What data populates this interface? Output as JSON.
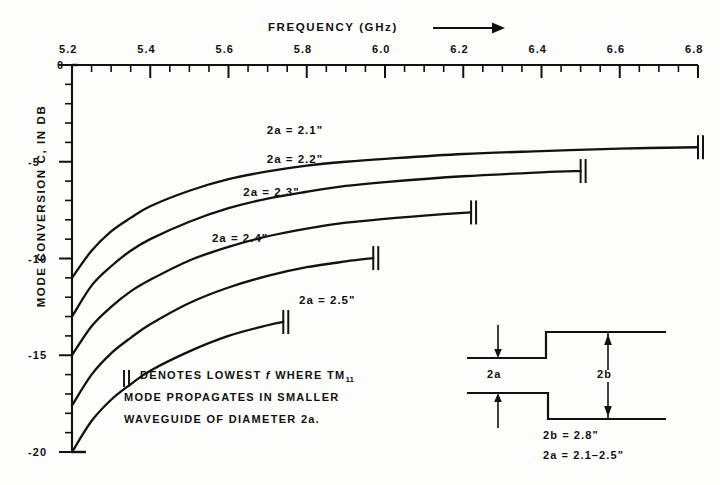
{
  "figure": {
    "kind": "engineering-line-chart",
    "ink_color": "#111111",
    "paper_color": "#fdfdfb"
  },
  "axes": {
    "x_title": "FREQUENCY   (GHz)",
    "x_title_arrow": "⟶",
    "y_title": "MODE CONVERSION  C,  IN  DB",
    "x_tick_labels": [
      "5.2",
      "5.4",
      "5.6",
      "5.8",
      "6.0",
      "6.2",
      "6.4",
      "6.6",
      "6.8"
    ],
    "y_tick_labels": [
      "0",
      "-5",
      "-10",
      "-15",
      "-20"
    ],
    "x_origin_label": "0"
  },
  "chart_data": {
    "type": "line",
    "xlabel": "FREQUENCY (GHz)",
    "ylabel": "MODE CONVERSION C, IN DB",
    "xlim": [
      5.2,
      6.8
    ],
    "ylim": [
      -20,
      0
    ],
    "xticks": [
      5.2,
      5.4,
      5.6,
      5.8,
      6.0,
      6.2,
      6.4,
      6.6,
      6.8
    ],
    "xtick_minor_step": 0.05,
    "yticks": [
      0,
      -5,
      -10,
      -15,
      -20
    ],
    "ytick_minor_step": 1,
    "grid": false,
    "legend": "inline-curve-labels",
    "series": [
      {
        "name": "2a = 2.1\"",
        "label": "2a = 2.1\"",
        "label_x": 5.8,
        "label_y": -3.4,
        "end_marker": "||",
        "end_marker_x": 6.8,
        "x": [
          5.2,
          5.25,
          5.3,
          5.35,
          5.4,
          5.5,
          5.6,
          5.7,
          5.8,
          5.9,
          6.0,
          6.2,
          6.4,
          6.6,
          6.8
        ],
        "y": [
          -11.0,
          -9.6,
          -8.6,
          -7.9,
          -7.3,
          -6.5,
          -5.9,
          -5.5,
          -5.2,
          -5.0,
          -4.85,
          -4.6,
          -4.45,
          -4.32,
          -4.25
        ]
      },
      {
        "name": "2a = 2.2\"",
        "label": "2a = 2.2\"",
        "label_x": 5.8,
        "label_y": -4.9,
        "end_marker": "||",
        "end_marker_x": 6.5,
        "x": [
          5.2,
          5.25,
          5.3,
          5.35,
          5.4,
          5.5,
          5.6,
          5.7,
          5.8,
          5.9,
          6.0,
          6.2,
          6.4,
          6.5
        ],
        "y": [
          -13.0,
          -11.4,
          -10.4,
          -9.6,
          -9.0,
          -8.1,
          -7.4,
          -6.9,
          -6.55,
          -6.25,
          -6.05,
          -5.75,
          -5.55,
          -5.48
        ]
      },
      {
        "name": "2a = 2.3\"",
        "label": "2a = 2.3\"",
        "label_x": 5.74,
        "label_y": -6.6,
        "end_marker": "||",
        "end_marker_x": 6.22,
        "x": [
          5.2,
          5.25,
          5.3,
          5.35,
          5.4,
          5.5,
          5.6,
          5.7,
          5.8,
          5.9,
          6.0,
          6.1,
          6.22
        ],
        "y": [
          -15.0,
          -13.5,
          -12.5,
          -11.7,
          -11.1,
          -10.1,
          -9.4,
          -8.85,
          -8.45,
          -8.15,
          -7.95,
          -7.78,
          -7.62
        ]
      },
      {
        "name": "2a = 2.4\"",
        "label": "2a = 2.4\"",
        "label_x": 5.66,
        "label_y": -9.0,
        "end_marker": "||",
        "end_marker_x": 5.97,
        "x": [
          5.2,
          5.25,
          5.3,
          5.35,
          5.4,
          5.5,
          5.6,
          5.7,
          5.8,
          5.9,
          5.97
        ],
        "y": [
          -17.6,
          -16.0,
          -14.9,
          -14.1,
          -13.4,
          -12.3,
          -11.5,
          -10.9,
          -10.45,
          -10.15,
          -9.98
        ]
      },
      {
        "name": "2a = 2.5\"",
        "label": "2a = 2.5\"",
        "label_x": 5.76,
        "label_y": -12.2,
        "end_marker": "||",
        "end_marker_x": 5.74,
        "x": [
          5.2,
          5.25,
          5.3,
          5.35,
          5.4,
          5.5,
          5.6,
          5.7,
          5.74
        ],
        "y": [
          -20.0,
          -18.4,
          -17.3,
          -16.5,
          -15.8,
          -14.8,
          -14.0,
          -13.45,
          -13.28
        ]
      }
    ]
  },
  "note": {
    "line1_marker": "||",
    "line1_a": "DENOTES LOWEST ",
    "line1_f": "f",
    "line1_b": " WHERE TM",
    "line1_sub": "11",
    "line2": "MODE PROPAGATES IN SMALLER",
    "line3": "WAVEGUIDE OF DIAMETER 2a."
  },
  "inset": {
    "label_2a": "2a",
    "label_2b": "2b",
    "caption_line1": "2b = 2.8\"",
    "caption_line2": "2a = 2.1–2.5\""
  }
}
